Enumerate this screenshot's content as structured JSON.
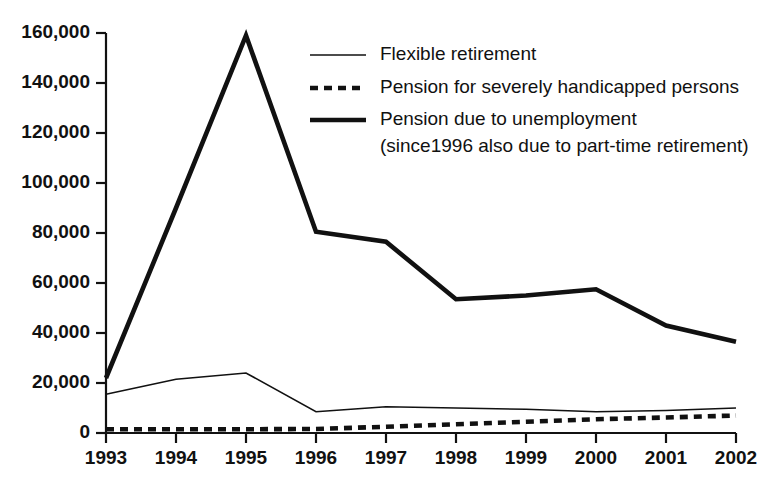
{
  "chart_data": {
    "type": "line",
    "title": "",
    "subtitle": "",
    "xlabel": "",
    "ylabel": "",
    "categories": [
      "1993",
      "1994",
      "1995",
      "1996",
      "1997",
      "1998",
      "1999",
      "2000",
      "2001",
      "2002"
    ],
    "x": [
      1993,
      1994,
      1995,
      1996,
      1997,
      1998,
      1999,
      2000,
      2001,
      2002
    ],
    "xlim": [
      1993,
      2002
    ],
    "ylim": [
      0,
      160000
    ],
    "ytick_values": [
      0,
      20000,
      40000,
      60000,
      80000,
      100000,
      120000,
      140000,
      160000
    ],
    "ytick_labels": [
      "0",
      "20,000",
      "40,000",
      "60,000",
      "80,000",
      "100,000",
      "120,000",
      "140,000",
      "160,000"
    ],
    "xtick_labels": [
      "1993",
      "1994",
      "1995",
      "1996",
      "1997",
      "1998",
      "1999",
      "2000",
      "2001",
      "2002"
    ],
    "grid": false,
    "legend_position": "top-right",
    "line_color": "#111111",
    "background_color": "#ffffff",
    "series": [
      {
        "name": "Flexible retirement",
        "style": "thin-solid",
        "values": [
          15500,
          21500,
          24000,
          8500,
          10500,
          10000,
          9500,
          8500,
          9000,
          10000
        ]
      },
      {
        "name": "Pension for severely handicapped persons",
        "style": "dashed",
        "values": [
          1500,
          1500,
          1500,
          1600,
          2500,
          3500,
          4500,
          5500,
          6200,
          7000
        ]
      },
      {
        "name": "Pension due to unemployment",
        "style": "thick-solid",
        "name_line2": "(since1996 also due to part-time retirement)",
        "values": [
          22000,
          90000,
          159000,
          80500,
          76500,
          53500,
          55000,
          57500,
          43000,
          36500
        ]
      }
    ]
  },
  "legend": {
    "entries": [
      {
        "label": "Flexible retirement",
        "swatch": "thin-solid-line-icon"
      },
      {
        "label": "Pension for severely handicapped persons",
        "swatch": "dashed-line-icon"
      },
      {
        "label": "Pension due to unemployment",
        "swatch": "thick-solid-line-icon"
      }
    ],
    "continuation_line": "(since1996 also due to part-time retirement)"
  },
  "axes": {
    "y_ticks": [
      "160,000",
      "140,000",
      "120,000",
      "100,000",
      "80,000",
      "60,000",
      "40,000",
      "20,000",
      "0"
    ],
    "x_ticks": [
      "1993",
      "1994",
      "1995",
      "1996",
      "1997",
      "1998",
      "1999",
      "2000",
      "2001",
      "2002"
    ]
  }
}
